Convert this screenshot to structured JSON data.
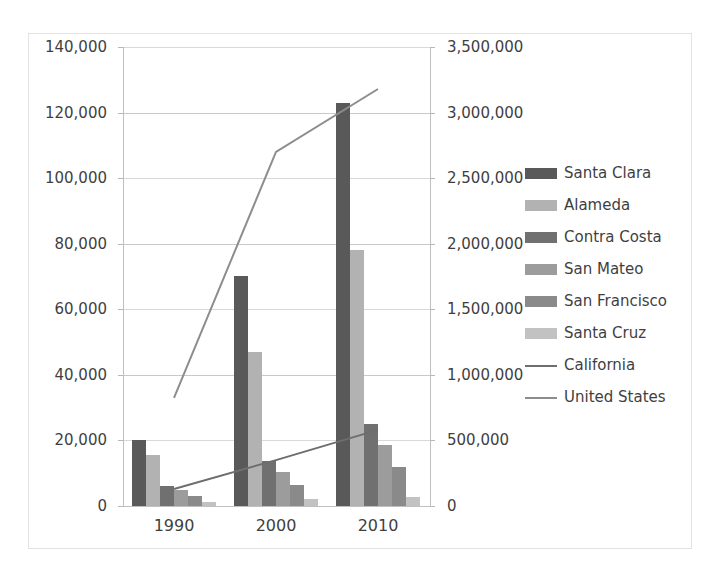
{
  "chart_data": {
    "type": "bar",
    "title": "",
    "subtitle": "",
    "xlabel": "",
    "ylabel": "",
    "categories": [
      "1990",
      "2000",
      "2010"
    ],
    "grid": true,
    "legend_position": "right",
    "primary_axis": {
      "name": "left",
      "ylim": [
        0,
        140000
      ],
      "tick_step": 20000,
      "ticks": [
        0,
        20000,
        40000,
        60000,
        80000,
        100000,
        120000,
        140000
      ],
      "tick_labels": [
        "0",
        "20,000",
        "40,000",
        "60,000",
        "80,000",
        "100,000",
        "120,000",
        "140,000"
      ]
    },
    "secondary_axis": {
      "name": "right",
      "ylim": [
        0,
        3500000
      ],
      "tick_step": 500000,
      "ticks": [
        0,
        500000,
        1000000,
        1500000,
        2000000,
        2500000,
        3000000,
        3500000
      ],
      "tick_labels": [
        "0",
        "500,000",
        "1,000,000",
        "1,500,000",
        "2,000,000",
        "2,500,000",
        "3,000,000",
        "3,500,000"
      ]
    },
    "series": [
      {
        "name": "Santa Clara",
        "kind": "bar",
        "axis": "left",
        "color": "#595959",
        "values": [
          20200,
          70300,
          123000
        ]
      },
      {
        "name": "Alameda",
        "kind": "bar",
        "axis": "left",
        "color": "#b2b2b2",
        "values": [
          15500,
          47000,
          78000
        ]
      },
      {
        "name": "Contra Costa",
        "kind": "bar",
        "axis": "left",
        "color": "#707070",
        "values": [
          6200,
          13800,
          25000
        ]
      },
      {
        "name": "San Mateo",
        "kind": "bar",
        "axis": "left",
        "color": "#9c9c9c",
        "values": [
          4800,
          10500,
          18500
        ]
      },
      {
        "name": "San Francisco",
        "kind": "bar",
        "axis": "left",
        "color": "#8a8a8a",
        "values": [
          3100,
          6300,
          12000
        ]
      },
      {
        "name": "Santa Cruz",
        "kind": "bar",
        "axis": "left",
        "color": "#c2c2c2",
        "values": [
          1100,
          2200,
          2600
        ]
      },
      {
        "name": "California",
        "kind": "line",
        "axis": "right",
        "color": "#6e6e6e",
        "values": [
          130000,
          350000,
          580000
        ]
      },
      {
        "name": "United States",
        "kind": "line",
        "axis": "right",
        "color": "#8d8d8d",
        "values": [
          825000,
          2700000,
          3180000
        ]
      }
    ]
  },
  "legend": {
    "items": [
      {
        "label": "Santa Clara",
        "type": "swatch",
        "color": "#595959"
      },
      {
        "label": "Alameda",
        "type": "swatch",
        "color": "#b2b2b2"
      },
      {
        "label": "Contra Costa",
        "type": "swatch",
        "color": "#707070"
      },
      {
        "label": "San Mateo",
        "type": "swatch",
        "color": "#9c9c9c"
      },
      {
        "label": "San Francisco",
        "type": "swatch",
        "color": "#8a8a8a"
      },
      {
        "label": "Santa Cruz",
        "type": "swatch",
        "color": "#c2c2c2"
      },
      {
        "label": "California",
        "type": "line",
        "color": "#6e6e6e"
      },
      {
        "label": "United States",
        "type": "line",
        "color": "#8d8d8d"
      }
    ]
  }
}
